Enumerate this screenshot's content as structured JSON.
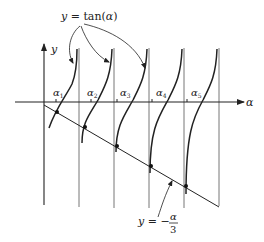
{
  "figure": {
    "type": "function-intersection-diagram",
    "curve_label": {
      "lhs": "y",
      "eq": " = ",
      "rhs": "tan(",
      "var": "α",
      "close": ")"
    },
    "line_label": {
      "lhs": "y",
      "eq": " = −",
      "num": "α",
      "den": "3"
    },
    "axes": {
      "x_label": "α",
      "y_label": "y"
    },
    "roots": [
      {
        "name": "α",
        "sub": "1"
      },
      {
        "name": "α",
        "sub": "2"
      },
      {
        "name": "α",
        "sub": "3"
      },
      {
        "name": "α",
        "sub": "4"
      },
      {
        "name": "α",
        "sub": "5"
      }
    ],
    "colors": {
      "ink": "#222222",
      "asymptote": "#777777",
      "background": "#ffffff"
    }
  }
}
